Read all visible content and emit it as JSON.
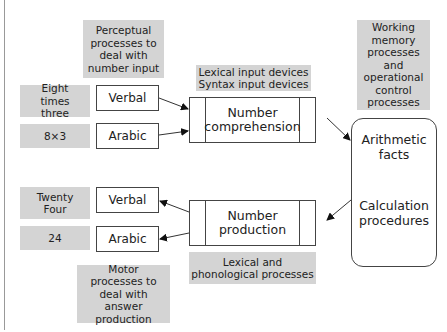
{
  "diagram": {
    "perceptual_label": "Perceptual processes to deal with number input",
    "lexical_input_label": "Lexical input devices\nSyntax input devices",
    "working_memory_label": "Working memory processes and operational control processes",
    "motor_label": "Motor processes to deal with answer production",
    "lexical_phono_label": "Lexical and phonological processes",
    "inputs": [
      {
        "example": "Eight times three",
        "format": "Verbal"
      },
      {
        "example": "8×3",
        "format": "Arabic"
      }
    ],
    "outputs": [
      {
        "example": "Twenty Four",
        "format": "Verbal"
      },
      {
        "example": "24",
        "format": "Arabic"
      }
    ],
    "comprehension_label": "Number comprehension",
    "production_label": "Number production",
    "central": {
      "facts_label": "Arithmetic facts",
      "procedures_label": "Calculation procedures"
    }
  }
}
